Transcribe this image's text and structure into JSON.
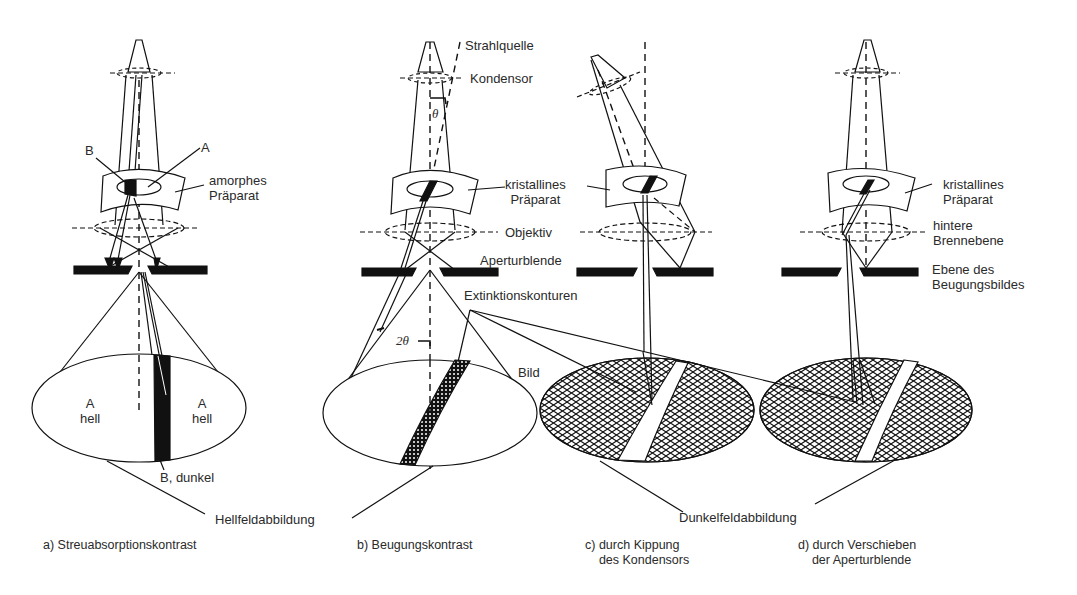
{
  "figure": {
    "topic": "TEM contrast mechanisms",
    "colors": {
      "ink": "#111111",
      "background": "#ffffff",
      "text": "#2a2a2a"
    }
  },
  "panels": [
    {
      "id": "a",
      "caption": "a) Streuabsorptionskontrast",
      "labels": {
        "region_b": "B",
        "region_a": "A",
        "specimen": "amorphes\nPräparat",
        "image_left": "A\nhell",
        "image_right": "A\nhell",
        "image_dark": "B, dunkel"
      }
    },
    {
      "id": "b",
      "caption": "b) Beugungskontrast",
      "labels": {
        "source": "Strahlquelle",
        "condenser": "Kondensor",
        "theta": "θ",
        "specimen": "kristallines\nPräparat",
        "objective": "Objektiv",
        "aperture": "Aperturblende",
        "extinction": "Extinktionskonturen",
        "two_theta": "2θ",
        "image": "Bild"
      }
    },
    {
      "id": "c",
      "caption": "c) durch Kippung\n    des Kondensors",
      "labels": {}
    },
    {
      "id": "d",
      "caption": "d) durch Verschieben\n    der Aperturblende",
      "labels": {
        "specimen": "kristallines\nPräparat",
        "back_focal_plane": "hintere\nBrennebene",
        "diffraction_plane": "Ebene des\nBeugungsbildes"
      }
    }
  ],
  "shared_labels": {
    "bright_field": "Hellfeldabbildung",
    "dark_field": "Dunkelfeldabbildung"
  }
}
